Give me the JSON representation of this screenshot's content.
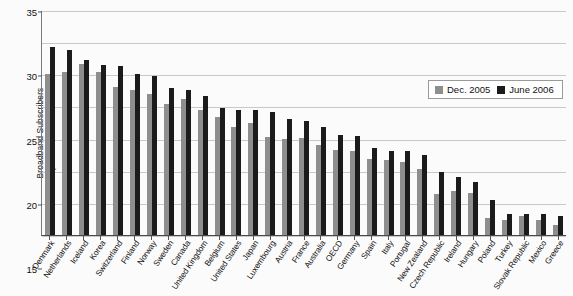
{
  "chart_data": {
    "type": "bar",
    "title": "",
    "xlabel": "",
    "ylabel": "Broadband Subscribers per 100 inhabitants",
    "ylabel_line1": "Broadband Subscribers",
    "ylabel_line2": "per 100 inhabitants",
    "ylim": [
      0,
      35
    ],
    "yticks": [
      0,
      5,
      10,
      15,
      20,
      25,
      30,
      35
    ],
    "grid": true,
    "legend_position": "top-right",
    "categories": [
      "Denmark",
      "Netherlands",
      "Iceland",
      "Korea",
      "Switzerland",
      "Finland",
      "Norway",
      "Sweden",
      "Canada",
      "United Kingdom",
      "Belgium",
      "United States",
      "Japan",
      "Luxembourg",
      "Austria",
      "France",
      "Australia",
      "OECD",
      "Germany",
      "Spain",
      "Italy",
      "Portugal",
      "New Zealand",
      "Czech Republic",
      "Ireland",
      "Hungary",
      "Poland",
      "Turkey",
      "Slovak Republic",
      "Mexico",
      "Greece"
    ],
    "series": [
      {
        "name": "Dec. 2005",
        "color": "#8e8e8e",
        "values": [
          25.0,
          25.3,
          26.6,
          25.4,
          23.1,
          22.5,
          22.0,
          20.4,
          21.1,
          19.4,
          18.3,
          16.8,
          17.4,
          15.3,
          15.0,
          15.1,
          14.0,
          13.3,
          13.0,
          11.8,
          11.7,
          11.3,
          10.3,
          6.4,
          6.9,
          6.5,
          2.7,
          2.4,
          2.9,
          2.4,
          1.6
        ],
        "label_dec_2005": "Dec. 2005"
      },
      {
        "name": "June 2006",
        "color": "#1b1b1b",
        "values": [
          29.3,
          28.8,
          27.3,
          26.5,
          26.3,
          25.1,
          24.7,
          22.8,
          22.5,
          21.6,
          19.7,
          19.5,
          19.4,
          19.1,
          18.0,
          17.7,
          16.8,
          15.5,
          15.4,
          13.5,
          13.1,
          13.0,
          12.4,
          9.8,
          9.0,
          8.3,
          5.5,
          3.2,
          3.3,
          3.3,
          3.0
        ],
        "label_june_2006": "June 2006"
      }
    ]
  },
  "legend": {
    "entries": [
      {
        "label": "Dec. 2005",
        "color": "#8e8e8e"
      },
      {
        "label": "June 2006",
        "color": "#1b1b1b"
      }
    ]
  }
}
